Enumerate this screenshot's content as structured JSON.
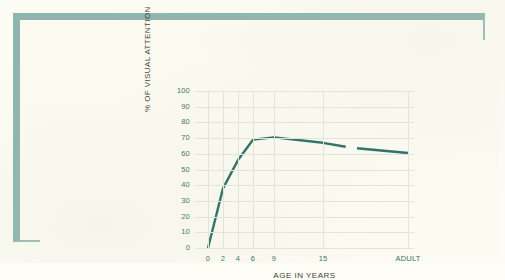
{
  "figure": {
    "frame_color": "#8fb5ae",
    "paper_color": "#fbfbf2",
    "line_color": "#2a7068",
    "text_color": "#3f6f66",
    "title_color": "#44413d"
  },
  "chart_data": {
    "type": "line",
    "title": "",
    "subtitle": "",
    "xlabel": "AGE IN YEARS",
    "ylabel": "% OF VISUAL ATTENTION",
    "ylim": [
      0,
      100
    ],
    "yticks": [
      0,
      10,
      20,
      30,
      40,
      50,
      60,
      70,
      80,
      90,
      100
    ],
    "ytick_labels": [
      "0",
      "10",
      "20",
      "30",
      "40",
      "50",
      "60",
      "70",
      "80",
      "90",
      "100"
    ],
    "xtick_labels": [
      "0",
      "2",
      "4",
      "6",
      "9",
      "15",
      "ADULT"
    ],
    "xtick_positions": [
      0,
      2,
      4,
      6,
      9,
      15,
      30
    ],
    "grid": true,
    "legend": false,
    "legend_position": "none",
    "axis_break": {
      "present": true,
      "between_x": [
        19,
        21
      ],
      "note": "line is interrupted before the ADULT category"
    },
    "series": [
      {
        "name": "% of visual attention",
        "color": "#2a7068",
        "x": [
          0,
          2,
          4,
          6,
          9,
          15,
          19,
          21,
          30
        ],
        "values": [
          0,
          38,
          56,
          69,
          70.5,
          67,
          64.5,
          63.5,
          60.5
        ]
      }
    ],
    "annotations": []
  }
}
